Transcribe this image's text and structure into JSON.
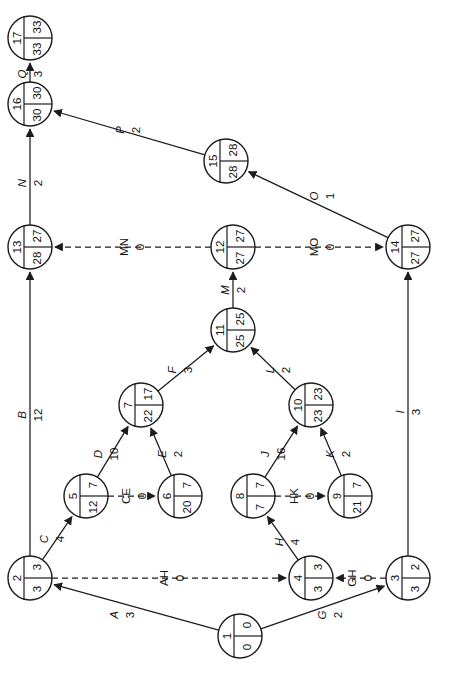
{
  "diagram": {
    "type": "pert-cpm-network",
    "orientation": "rotated-90-ccw",
    "node_fields": [
      "id",
      "earliest",
      "latest"
    ],
    "nodes": [
      {
        "id": "1",
        "earliest": "0",
        "latest": "0",
        "cx": 240,
        "cy": 636,
        "r": 22
      },
      {
        "id": "2",
        "earliest": "3",
        "latest": "3",
        "cx": 30,
        "cy": 578,
        "r": 22
      },
      {
        "id": "3",
        "earliest": "2",
        "latest": "3",
        "cx": 408,
        "cy": 578,
        "r": 22
      },
      {
        "id": "4",
        "earliest": "3",
        "latest": "3",
        "cx": 311,
        "cy": 578,
        "r": 22
      },
      {
        "id": "5",
        "earliest": "7",
        "latest": "12",
        "cx": 86,
        "cy": 496,
        "r": 22
      },
      {
        "id": "6",
        "earliest": "7",
        "latest": "20",
        "cx": 180,
        "cy": 496,
        "r": 22
      },
      {
        "id": "7",
        "earliest": "17",
        "latest": "22",
        "cx": 141,
        "cy": 405,
        "r": 22
      },
      {
        "id": "8",
        "earliest": "7",
        "latest": "7",
        "cx": 253,
        "cy": 496,
        "r": 22
      },
      {
        "id": "9",
        "earliest": "7",
        "latest": "21",
        "cx": 350,
        "cy": 496,
        "r": 22
      },
      {
        "id": "10",
        "earliest": "23",
        "latest": "23",
        "cx": 311,
        "cy": 405,
        "r": 22
      },
      {
        "id": "11",
        "earliest": "25",
        "latest": "25",
        "cx": 233,
        "cy": 330,
        "r": 22
      },
      {
        "id": "12",
        "earliest": "27",
        "latest": "27",
        "cx": 233,
        "cy": 247,
        "r": 22
      },
      {
        "id": "13",
        "earliest": "27",
        "latest": "28",
        "cx": 30,
        "cy": 247,
        "r": 22
      },
      {
        "id": "14",
        "earliest": "27",
        "latest": "27",
        "cx": 408,
        "cy": 247,
        "r": 22
      },
      {
        "id": "15",
        "earliest": "28",
        "latest": "28",
        "cx": 226,
        "cy": 161,
        "r": 22
      },
      {
        "id": "16",
        "earliest": "30",
        "latest": "30",
        "cx": 30,
        "cy": 104,
        "r": 22
      },
      {
        "id": "17",
        "earliest": "33",
        "latest": "33",
        "cx": 30,
        "cy": 38,
        "r": 22
      }
    ],
    "edges": [
      {
        "name": "A",
        "duration": "3",
        "from": "1",
        "to": "2",
        "dummy": false,
        "lx": 122,
        "ly": 615
      },
      {
        "name": "G",
        "duration": "2",
        "from": "1",
        "to": "3",
        "dummy": false,
        "lx": 330,
        "ly": 615
      },
      {
        "name": "C",
        "duration": "4",
        "from": "2",
        "to": "5",
        "dummy": false,
        "lx": 52,
        "ly": 539
      },
      {
        "name": "B",
        "duration": "12",
        "from": "2",
        "to": "13",
        "dummy": false,
        "lx": 30,
        "ly": 415
      },
      {
        "name": "AH",
        "duration": "0",
        "from": "2",
        "to": "4",
        "dummy": true,
        "lx": 172,
        "ly": 578
      },
      {
        "name": "GH",
        "duration": "0",
        "from": "3",
        "to": "4",
        "dummy": true,
        "lx": 360,
        "ly": 578
      },
      {
        "name": "I",
        "duration": "3",
        "from": "3",
        "to": "14",
        "dummy": false,
        "lx": 408,
        "ly": 412
      },
      {
        "name": "H",
        "duration": "4",
        "from": "4",
        "to": "8",
        "dummy": false,
        "lx": 287,
        "ly": 542
      },
      {
        "name": "D",
        "duration": "10",
        "from": "5",
        "to": "7",
        "dummy": false,
        "lx": 106,
        "ly": 454
      },
      {
        "name": "CE",
        "duration": "0",
        "from": "5",
        "to": "6",
        "dummy": true,
        "lx": 134,
        "ly": 496
      },
      {
        "name": "E",
        "duration": "2",
        "from": "6",
        "to": "7",
        "dummy": false,
        "lx": 170,
        "ly": 454
      },
      {
        "name": "F",
        "duration": "3",
        "from": "7",
        "to": "11",
        "dummy": false,
        "lx": 180,
        "ly": 370
      },
      {
        "name": "J",
        "duration": "16",
        "from": "8",
        "to": "10",
        "dummy": false,
        "lx": 273,
        "ly": 454
      },
      {
        "name": "HK",
        "duration": "0",
        "from": "8",
        "to": "9",
        "dummy": true,
        "lx": 302,
        "ly": 496
      },
      {
        "name": "K",
        "duration": "2",
        "from": "9",
        "to": "10",
        "dummy": false,
        "lx": 338,
        "ly": 454
      },
      {
        "name": "L",
        "duration": "2",
        "from": "10",
        "to": "11",
        "dummy": false,
        "lx": 278,
        "ly": 370
      },
      {
        "name": "M",
        "duration": "2",
        "from": "11",
        "to": "12",
        "dummy": false,
        "lx": 233,
        "ly": 290
      },
      {
        "name": "MN",
        "duration": "0",
        "from": "12",
        "to": "13",
        "dummy": true,
        "lx": 132,
        "ly": 247
      },
      {
        "name": "MO",
        "duration": "0",
        "from": "12",
        "to": "14",
        "dummy": true,
        "lx": 322,
        "ly": 247
      },
      {
        "name": "O",
        "duration": "1",
        "from": "14",
        "to": "15",
        "dummy": false,
        "lx": 322,
        "ly": 196
      },
      {
        "name": "P",
        "duration": "2",
        "from": "15",
        "to": "16",
        "dummy": false,
        "lx": 128,
        "ly": 130
      },
      {
        "name": "N",
        "duration": "2",
        "from": "13",
        "to": "16",
        "dummy": false,
        "lx": 30,
        "ly": 183
      },
      {
        "name": "Q",
        "duration": "3",
        "from": "16",
        "to": "17",
        "dummy": false,
        "lx": 30,
        "ly": 74
      }
    ],
    "colors": {
      "ink": "#1c1c1c",
      "background": "#ffffff"
    }
  }
}
